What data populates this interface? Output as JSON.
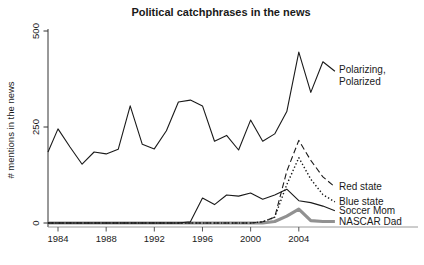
{
  "title": "Political catchphrases in the news",
  "chart_data": {
    "type": "line",
    "title": "Political catchphrases in the news",
    "xlabel": "",
    "ylabel": "# mentions in the news",
    "ylim": [
      0,
      500
    ],
    "xlim": [
      1983,
      2007
    ],
    "grid": false,
    "legend_position": "right-of-line-ends",
    "y_ticks": [
      "0",
      "250",
      "500"
    ],
    "y_tick_values": [
      0,
      250,
      500
    ],
    "x_ticks": [
      "1984",
      "1988",
      "1992",
      "1996",
      "2000",
      "2004"
    ],
    "x_tick_values": [
      1984,
      1988,
      1992,
      1996,
      2000,
      2004
    ],
    "x": [
      1983,
      1984,
      1985,
      1986,
      1987,
      1988,
      1989,
      1990,
      1991,
      1992,
      1993,
      1994,
      1995,
      1996,
      1997,
      1998,
      1999,
      2000,
      2001,
      2002,
      2003,
      2004,
      2005,
      2006,
      2007
    ],
    "series": [
      {
        "name": "Polarizing, Polarized",
        "label_lines": [
          "Polarizing,",
          "Polarized"
        ],
        "style": "solid",
        "color": "#1a1a1a",
        "width": 1.1,
        "values": [
          185,
          245,
          198,
          153,
          185,
          180,
          192,
          305,
          205,
          193,
          240,
          315,
          320,
          305,
          213,
          228,
          190,
          268,
          213,
          232,
          290,
          445,
          340,
          420,
          395
        ]
      },
      {
        "name": "Red state",
        "label_lines": [
          "Red state"
        ],
        "style": "dashed",
        "color": "#1a1a1a",
        "width": 1.1,
        "values": [
          0,
          0,
          0,
          0,
          0,
          0,
          0,
          0,
          0,
          0,
          0,
          0,
          0,
          0,
          0,
          0,
          0,
          0,
          3,
          15,
          135,
          215,
          163,
          120,
          94
        ]
      },
      {
        "name": "Blue state",
        "label_lines": [
          "Blue state"
        ],
        "style": "dotted",
        "color": "#1a1a1a",
        "width": 1.4,
        "values": [
          0,
          0,
          0,
          0,
          0,
          0,
          0,
          0,
          0,
          0,
          0,
          0,
          0,
          0,
          0,
          0,
          0,
          0,
          3,
          15,
          100,
          170,
          114,
          74,
          55
        ]
      },
      {
        "name": "Soccer Mom",
        "label_lines": [
          "Soccer Mom"
        ],
        "style": "solid",
        "color": "#1a1a1a",
        "width": 1.1,
        "values": [
          0,
          0,
          0,
          0,
          0,
          0,
          0,
          0,
          0,
          0,
          0,
          0,
          3,
          65,
          48,
          73,
          70,
          78,
          62,
          73,
          88,
          58,
          53,
          44,
          32
        ]
      },
      {
        "name": "NASCAR Dad",
        "label_lines": [
          "NASCAR Dad"
        ],
        "style": "solid",
        "color": "#919191",
        "width": 3.2,
        "values": [
          0,
          0,
          0,
          0,
          0,
          0,
          0,
          0,
          0,
          0,
          0,
          0,
          0,
          0,
          0,
          0,
          0,
          0,
          0,
          4,
          18,
          36,
          6,
          4,
          4
        ]
      }
    ]
  }
}
